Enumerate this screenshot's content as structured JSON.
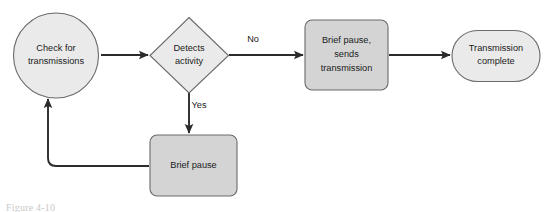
{
  "figure": {
    "type": "flowchart",
    "background_color": "#ffffff",
    "caption": "Figure 4-10"
  },
  "style": {
    "node_fill_light": "#eaeaea",
    "node_fill_dark": "#d4d4d4",
    "stroke_color": "#4a4a4a",
    "edge_color": "#2b2b2b",
    "text_color": "#1b1b1b"
  },
  "nodes": [
    {
      "id": "check",
      "shape": "circle",
      "label_line1": "Check for",
      "label_line2": "transmissions"
    },
    {
      "id": "detects",
      "shape": "diamond",
      "label_line1": "Detects",
      "label_line2": "activity"
    },
    {
      "id": "pause_send",
      "shape": "rounded-rect",
      "label_line1": "Brief pause,",
      "label_line2": "sends",
      "label_line3": "transmission"
    },
    {
      "id": "complete",
      "shape": "stadium",
      "label_line1": "Transmission",
      "label_line2": "complete"
    },
    {
      "id": "brief_pause",
      "shape": "rounded-rect",
      "label_line1": "Brief pause"
    }
  ],
  "edges": [
    {
      "id": "check-to-detects",
      "from": "check",
      "to": "detects",
      "label": ""
    },
    {
      "id": "detects-to-pause-send",
      "from": "detects",
      "to": "pause_send",
      "label": "No"
    },
    {
      "id": "pause-send-to-complete",
      "from": "pause_send",
      "to": "complete",
      "label": ""
    },
    {
      "id": "detects-to-brief-pause",
      "from": "detects",
      "to": "brief_pause",
      "label": "Yes"
    },
    {
      "id": "brief-pause-to-check",
      "from": "brief_pause",
      "to": "check",
      "label": ""
    }
  ]
}
